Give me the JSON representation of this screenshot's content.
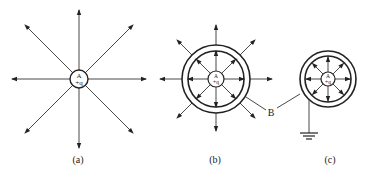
{
  "diagram": {
    "type": "electric field lines / electrostatic shielding",
    "panels": [
      {
        "id": "a",
        "caption": "(a)",
        "center_charge": {
          "label_top": "A",
          "label_bottom": "+q"
        },
        "field_lines": 8,
        "description": "Isolated positive point charge with radial field lines"
      },
      {
        "id": "b",
        "caption": "(b)",
        "center_charge": {
          "label_top": "A",
          "label_bottom": "+q"
        },
        "shell_label": "B",
        "induced_inner": "-",
        "induced_outer": "+",
        "field_lines": 8,
        "description": "Charge inside ungrounded conducting shell; field extends outside"
      },
      {
        "id": "c",
        "caption": "(c)",
        "center_charge": {
          "label_top": "A",
          "label_bottom": "+q"
        },
        "induced_inner": "-",
        "grounded": true,
        "field_lines": 8,
        "description": "Charge inside grounded conducting shell; no field outside"
      }
    ],
    "colors": {
      "line": "#333333",
      "background": "#ffffff"
    }
  }
}
